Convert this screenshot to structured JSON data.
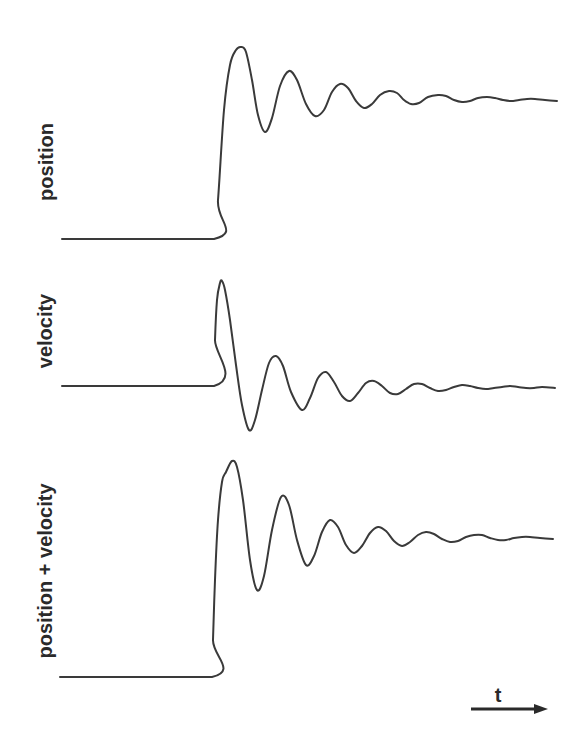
{
  "chart_data": {
    "type": "line",
    "title": "",
    "xlabel": "t",
    "grid": false,
    "legend": "none",
    "panels": [
      {
        "name": "position",
        "ylabel": "position",
        "label_center": [
          46,
          162
        ],
        "description": "Step from low baseline to a damped oscillation settling at a higher level",
        "points": [
          [
            62,
            239
          ],
          [
            214,
            239
          ],
          [
            218,
            200
          ],
          [
            224,
            110
          ],
          [
            230,
            65
          ],
          [
            236,
            50
          ],
          [
            241,
            47
          ],
          [
            246,
            52
          ],
          [
            252,
            80
          ],
          [
            258,
            115
          ],
          [
            265,
            132
          ],
          [
            272,
            118
          ],
          [
            280,
            86
          ],
          [
            289,
            71
          ],
          [
            297,
            80
          ],
          [
            306,
            104
          ],
          [
            315,
            116
          ],
          [
            324,
            110
          ],
          [
            332,
            92
          ],
          [
            340,
            84
          ],
          [
            348,
            88
          ],
          [
            356,
            101
          ],
          [
            364,
            108
          ],
          [
            372,
            104
          ],
          [
            380,
            95
          ],
          [
            389,
            91
          ],
          [
            397,
            93
          ],
          [
            404,
            100
          ],
          [
            411,
            104
          ],
          [
            419,
            103
          ],
          [
            428,
            97
          ],
          [
            438,
            95
          ],
          [
            446,
            96
          ],
          [
            454,
            100
          ],
          [
            462,
            102
          ],
          [
            470,
            101
          ],
          [
            478,
            98
          ],
          [
            487,
            97
          ],
          [
            495,
            98
          ],
          [
            503,
            100
          ],
          [
            511,
            101
          ],
          [
            519,
            100
          ],
          [
            527,
            99
          ],
          [
            535,
            99
          ],
          [
            545,
            100
          ],
          [
            557,
            101
          ]
        ]
      },
      {
        "name": "velocity",
        "ylabel": "velocity",
        "label_center": [
          45,
          331
        ],
        "description": "Flat zero baseline, sharp positive spike, then damped oscillation about zero",
        "points": [
          [
            62,
            386
          ],
          [
            214,
            386
          ],
          [
            215,
            340
          ],
          [
            217,
            300
          ],
          [
            220,
            283
          ],
          [
            222,
            281
          ],
          [
            225,
            290
          ],
          [
            230,
            320
          ],
          [
            236,
            365
          ],
          [
            242,
            405
          ],
          [
            249,
            430
          ],
          [
            255,
            420
          ],
          [
            262,
            390
          ],
          [
            269,
            363
          ],
          [
            276,
            356
          ],
          [
            283,
            366
          ],
          [
            291,
            392
          ],
          [
            302,
            410
          ],
          [
            310,
            398
          ],
          [
            318,
            378
          ],
          [
            326,
            372
          ],
          [
            334,
            382
          ],
          [
            342,
            396
          ],
          [
            350,
            401
          ],
          [
            358,
            393
          ],
          [
            366,
            383
          ],
          [
            374,
            381
          ],
          [
            382,
            386
          ],
          [
            390,
            393
          ],
          [
            398,
            394
          ],
          [
            406,
            389
          ],
          [
            414,
            384
          ],
          [
            422,
            384
          ],
          [
            430,
            388
          ],
          [
            438,
            391
          ],
          [
            446,
            390
          ],
          [
            454,
            387
          ],
          [
            462,
            385
          ],
          [
            470,
            386
          ],
          [
            478,
            388
          ],
          [
            486,
            389
          ],
          [
            494,
            388
          ],
          [
            502,
            387
          ],
          [
            510,
            386
          ],
          [
            518,
            387
          ],
          [
            526,
            388
          ],
          [
            534,
            388
          ],
          [
            542,
            387
          ],
          [
            555,
            388
          ]
        ]
      },
      {
        "name": "position + velocity",
        "ylabel": "position + velocity",
        "label_center": [
          45,
          571
        ],
        "description": "Sum signal: step with sharper overshoot shoulder, damped oscillation settling at a higher level",
        "points": [
          [
            60,
            677
          ],
          [
            212,
            677
          ],
          [
            213,
            640
          ],
          [
            215,
            580
          ],
          [
            218,
            520
          ],
          [
            222,
            482
          ],
          [
            226,
            472
          ],
          [
            232,
            461
          ],
          [
            237,
            467
          ],
          [
            243,
            500
          ],
          [
            250,
            560
          ],
          [
            257,
            590
          ],
          [
            264,
            576
          ],
          [
            272,
            530
          ],
          [
            281,
            497
          ],
          [
            289,
            505
          ],
          [
            297,
            540
          ],
          [
            306,
            565
          ],
          [
            314,
            556
          ],
          [
            322,
            532
          ],
          [
            330,
            520
          ],
          [
            338,
            527
          ],
          [
            346,
            545
          ],
          [
            354,
            553
          ],
          [
            362,
            546
          ],
          [
            370,
            533
          ],
          [
            378,
            527
          ],
          [
            386,
            531
          ],
          [
            394,
            541
          ],
          [
            402,
            546
          ],
          [
            410,
            542
          ],
          [
            418,
            535
          ],
          [
            426,
            532
          ],
          [
            434,
            534
          ],
          [
            442,
            539
          ],
          [
            450,
            542
          ],
          [
            458,
            541
          ],
          [
            466,
            537
          ],
          [
            474,
            535
          ],
          [
            482,
            535
          ],
          [
            490,
            538
          ],
          [
            498,
            540
          ],
          [
            506,
            540
          ],
          [
            514,
            538
          ],
          [
            522,
            537
          ],
          [
            530,
            537
          ],
          [
            540,
            538
          ],
          [
            553,
            539
          ]
        ]
      }
    ],
    "time_arrow": {
      "label": "t",
      "x1": 471,
      "x2": 548,
      "y": 709,
      "label_pos": [
        498,
        702
      ]
    }
  }
}
